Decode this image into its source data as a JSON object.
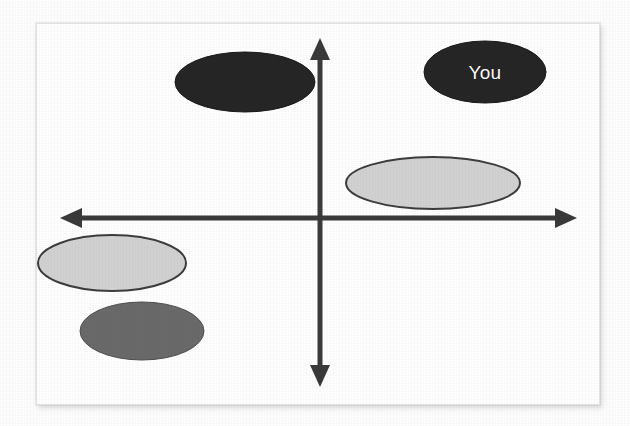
{
  "figure": {
    "type": "positioning-map",
    "background_color": "#ffffff",
    "frame_color": "#e6e6e6",
    "axis_color": "#3a3a3a"
  },
  "chart_data": {
    "type": "scatter",
    "title": "",
    "subtitle": "",
    "xlabel": "",
    "ylabel": "",
    "xlim": [
      -100,
      100
    ],
    "ylim": [
      -100,
      100
    ],
    "grid": false,
    "legend": "none",
    "axis_style": "double-headed-arrows-crossing-at-origin",
    "origin": {
      "x": 320,
      "y": 218
    },
    "axes": {
      "vertical": {
        "x": 320,
        "top_tip_y": 38,
        "bottom_tip_y": 387,
        "arrowheads": "both"
      },
      "horizontal": {
        "y": 218,
        "left_tip_x": 60,
        "right_tip_x": 577,
        "arrowheads": "both"
      }
    },
    "annotations": [
      {
        "text": "You",
        "attached_to": "bubble-you",
        "color": "#ffffff"
      }
    ],
    "points": [
      {
        "id": "bubble-upper-left-dark",
        "label": "",
        "quadrant": "II",
        "cx": 245,
        "cy": 82,
        "rx": 70,
        "ry": 30,
        "fill": "#262626",
        "stroke": "#1a1a1a",
        "stroke_width": 1,
        "x_value": -53,
        "y_value": 62
      },
      {
        "id": "bubble-you",
        "label": "You",
        "quadrant": "I",
        "cx": 485,
        "cy": 72,
        "rx": 61,
        "ry": 31,
        "fill": "#262626",
        "stroke": "#1a1a1a",
        "stroke_width": 1,
        "x_value": 64,
        "y_value": 67
      },
      {
        "id": "bubble-right-light",
        "label": "",
        "quadrant": "I",
        "cx": 433,
        "cy": 183,
        "rx": 87,
        "ry": 26,
        "fill": "#d2d2d2",
        "stroke": "#3d3d3d",
        "stroke_width": 2,
        "x_value": 44,
        "y_value": 16
      },
      {
        "id": "bubble-left-light",
        "label": "",
        "quadrant": "III",
        "cx": 112,
        "cy": 263,
        "rx": 74,
        "ry": 28,
        "fill": "#d2d2d2",
        "stroke": "#3d3d3d",
        "stroke_width": 2,
        "x_value": -79,
        "y_value": -21
      },
      {
        "id": "bubble-bottom-mid-gray",
        "label": "",
        "quadrant": "III",
        "cx": 142,
        "cy": 331,
        "rx": 62,
        "ry": 29,
        "fill": "#6a6a6a",
        "stroke": "#4f4f4f",
        "stroke_width": 1,
        "x_value": -66,
        "y_value": -60
      }
    ]
  }
}
